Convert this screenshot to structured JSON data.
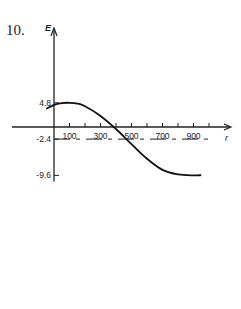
{
  "question_number": "10.",
  "chart_data": {
    "type": "line",
    "title": "",
    "xlabel": "r",
    "ylabel": "E",
    "x_tick_labels": [
      "100",
      "300",
      "500",
      "700",
      "900"
    ],
    "x_ticks": [
      100,
      200,
      300,
      400,
      500,
      600,
      700,
      800,
      900,
      1000
    ],
    "y_tick_labels": [
      "4.8",
      "-2.4",
      "-9.6"
    ],
    "y_ticks": [
      4.8,
      -2.4,
      -9.6
    ],
    "xlim": [
      0,
      1050
    ],
    "ylim": [
      -10,
      6
    ],
    "grid": false,
    "series": [
      {
        "name": "E(r)",
        "style": "solid",
        "x": [
          -50,
          0,
          50,
          100,
          150,
          200,
          300,
          400,
          500,
          600,
          700,
          800,
          900,
          950
        ],
        "y": [
          3.6,
          4.4,
          4.75,
          4.8,
          4.65,
          4.1,
          2.2,
          -0.4,
          -3.4,
          -6.3,
          -8.5,
          -9.4,
          -9.6,
          -9.55
        ]
      },
      {
        "name": "E = -2.4",
        "style": "dashed",
        "x": [
          0,
          1000
        ],
        "y": [
          -2.4,
          -2.4
        ]
      }
    ],
    "annotations": []
  }
}
